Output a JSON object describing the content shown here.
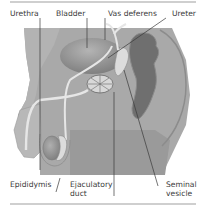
{
  "diagram": {
    "type": "anatomical cross-section",
    "labels": {
      "urethra": "Urethra",
      "bladder": "Bladder",
      "vas_deferens": "Vas deferens",
      "ureter": "Ureter",
      "epididymis": "Epididymis",
      "ejaculatory_duct_line1": "Ejaculatory",
      "ejaculatory_duct_line2": "duct",
      "seminal_vesicle_line1": "Seminal",
      "seminal_vesicle_line2": "vesicle"
    },
    "colors": {
      "body": "#a9a9a9",
      "body_light": "#bdbdbd",
      "bladder": "#8e8e8e",
      "rectum": "#6f6f6f",
      "duct": "#e6e6e6",
      "leader_line": "#3a3a3a",
      "rule": "#cfcfcf"
    }
  }
}
